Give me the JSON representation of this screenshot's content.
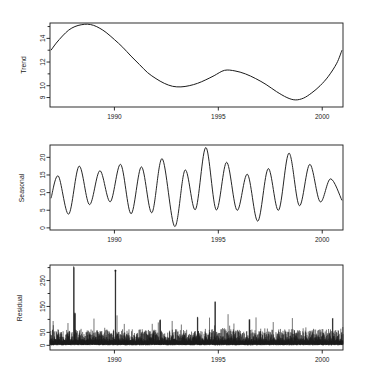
{
  "figure": {
    "type": "time-series-decomposition",
    "background": "#ffffff",
    "line_color": "#1a1a1a",
    "panel_count": 3
  },
  "chart_data": [
    {
      "type": "line",
      "title": "",
      "xlabel": "",
      "ylabel": "Trend",
      "xlim": [
        1986.9,
        2001.0
      ],
      "ylim": [
        8.2,
        15.3
      ],
      "yticks": [
        9,
        10,
        12,
        14
      ],
      "ytick_labels": [
        "9",
        "10",
        "12",
        "14"
      ],
      "yminor": [
        11,
        13,
        15
      ],
      "xticks": [
        1990,
        1995,
        2000
      ],
      "xtick_labels": [
        "1990",
        "1995",
        "2000"
      ],
      "grid": false,
      "legend": "none",
      "x": [
        1986.95,
        1987.2,
        1987.5,
        1987.8,
        1988.1,
        1988.4,
        1988.7,
        1989.0,
        1989.3,
        1989.6,
        1990.0,
        1990.4,
        1990.8,
        1991.2,
        1991.6,
        1992.0,
        1992.4,
        1992.8,
        1993.2,
        1993.6,
        1994.0,
        1994.4,
        1994.8,
        1995.3,
        1995.8,
        1996.3,
        1996.8,
        1997.3,
        1997.8,
        1998.3,
        1998.7,
        1999.1,
        1999.5,
        1999.9,
        2000.3,
        2000.7,
        2000.95
      ],
      "values": [
        13.0,
        13.6,
        14.2,
        14.7,
        15.0,
        15.15,
        15.2,
        15.1,
        14.85,
        14.5,
        13.9,
        13.25,
        12.5,
        11.8,
        11.1,
        10.6,
        10.2,
        9.95,
        9.9,
        10.0,
        10.2,
        10.5,
        10.85,
        11.3,
        11.25,
        11.0,
        10.6,
        10.1,
        9.5,
        9.0,
        8.8,
        8.95,
        9.4,
        10.0,
        10.8,
        11.9,
        13.0
      ]
    },
    {
      "type": "line",
      "title": "",
      "xlabel": "",
      "ylabel": "Seasonal",
      "xlim": [
        1986.9,
        2001.0
      ],
      "ylim": [
        -0.6,
        23.5
      ],
      "yticks": [
        0,
        5,
        10,
        15,
        20
      ],
      "ytick_labels": [
        "0",
        "5",
        "10",
        "15",
        "20"
      ],
      "xticks": [
        1990,
        1995,
        2000
      ],
      "xtick_labels": [
        "1990",
        "1995",
        "2000"
      ],
      "grid": false,
      "legend": "none",
      "period_years": 1.0,
      "cycle_peaks": [
        {
          "year": 1987.3,
          "value": 14.7
        },
        {
          "year": 1988.3,
          "value": 17.5
        },
        {
          "year": 1989.3,
          "value": 16.2
        },
        {
          "year": 1990.3,
          "value": 18.0
        },
        {
          "year": 1991.3,
          "value": 17.3
        },
        {
          "year": 1992.3,
          "value": 19.6
        },
        {
          "year": 1993.4,
          "value": 16.4
        },
        {
          "year": 1994.4,
          "value": 22.8
        },
        {
          "year": 1995.4,
          "value": 18.6
        },
        {
          "year": 1996.4,
          "value": 15.2
        },
        {
          "year": 1997.4,
          "value": 16.8
        },
        {
          "year": 1998.4,
          "value": 21.2
        },
        {
          "year": 1999.4,
          "value": 18.0
        },
        {
          "year": 2000.4,
          "value": 13.9
        }
      ],
      "cycle_troughs": [
        {
          "year": 1986.95,
          "value": 8.4
        },
        {
          "year": 1987.8,
          "value": 3.9
        },
        {
          "year": 1988.8,
          "value": 6.6
        },
        {
          "year": 1989.8,
          "value": 7.4
        },
        {
          "year": 1990.8,
          "value": 4.0
        },
        {
          "year": 1991.8,
          "value": 4.3
        },
        {
          "year": 1992.9,
          "value": 0.4
        },
        {
          "year": 1993.9,
          "value": 5.2
        },
        {
          "year": 1994.9,
          "value": 5.1
        },
        {
          "year": 1995.9,
          "value": 5.0
        },
        {
          "year": 1996.9,
          "value": 1.9
        },
        {
          "year": 1997.9,
          "value": 5.0
        },
        {
          "year": 1998.9,
          "value": 6.3
        },
        {
          "year": 1999.9,
          "value": 7.4
        },
        {
          "year": 2000.95,
          "value": 7.8
        }
      ]
    },
    {
      "type": "line",
      "title": "",
      "xlabel": "",
      "ylabel": "Residual",
      "xlim": [
        1986.9,
        2001.0
      ],
      "ylim": [
        -18,
        310
      ],
      "yticks": [
        0,
        50,
        150,
        250
      ],
      "ytick_labels": [
        "0",
        "50",
        "150",
        "250"
      ],
      "yminor": [
        100,
        200,
        300
      ],
      "xticks": [
        1990,
        1995,
        2000
      ],
      "xtick_labels": [
        "1990",
        "1995",
        "2000"
      ],
      "grid": false,
      "legend": "none",
      "noise_description": "dense high-frequency spiky residual series, baseline near 0, typical spikes 20-60",
      "baseline": 0,
      "typical_spike_range": [
        15,
        60
      ],
      "notable_spikes": [
        {
          "year": 1988.05,
          "value": 300
        },
        {
          "year": 1988.1,
          "value": 120
        },
        {
          "year": 1990.05,
          "value": 288
        },
        {
          "year": 1992.2,
          "value": 95
        },
        {
          "year": 1994.0,
          "value": 105
        },
        {
          "year": 1994.85,
          "value": 168
        },
        {
          "year": 1996.5,
          "value": 95
        },
        {
          "year": 2000.5,
          "value": 100
        }
      ]
    }
  ]
}
